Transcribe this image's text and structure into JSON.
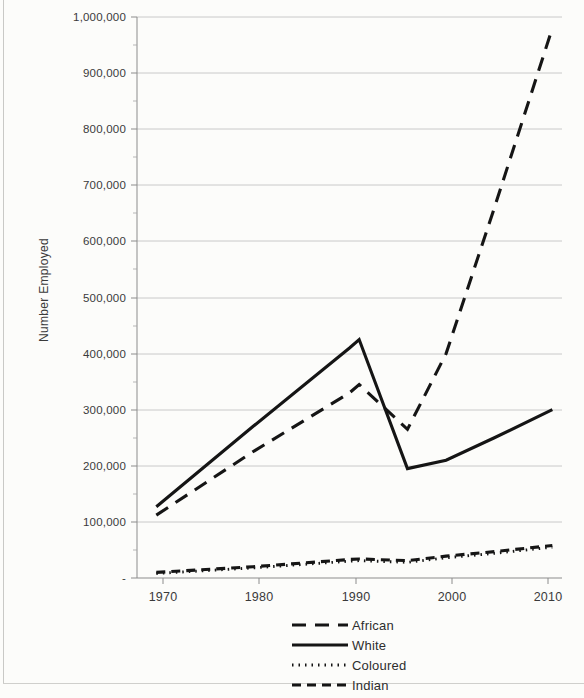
{
  "chart_data": {
    "type": "line",
    "title": "",
    "xlabel": "",
    "ylabel": "Number Employed",
    "x": [
      1970,
      1980,
      1990,
      1991,
      1996,
      2000,
      2005,
      2011
    ],
    "xlim": [
      1968,
      2012
    ],
    "ylim": [
      0,
      1000000
    ],
    "xticks": [
      1970,
      1980,
      1990,
      2000,
      2010
    ],
    "xtick_labels": [
      "1970",
      "1980",
      "1990",
      "2000",
      "2010"
    ],
    "yticks": [
      0,
      100000,
      200000,
      300000,
      400000,
      500000,
      600000,
      700000,
      800000,
      900000,
      1000000
    ],
    "ytick_labels": [
      "-",
      "100,000",
      "200,000",
      "300,000",
      "400,000",
      "500,000",
      "600,000",
      "700,000",
      "800,000",
      "900,000",
      "1,000,000"
    ],
    "grid": true,
    "legend_position": "bottom-center",
    "series": [
      {
        "name": "African",
        "style": "long-dashed",
        "points": [
          {
            "x": 1970,
            "y": 112000
          },
          {
            "x": 1980,
            "y": 225000
          },
          {
            "x": 1990,
            "y": 330000
          },
          {
            "x": 1991,
            "y": 345000
          },
          {
            "x": 1996,
            "y": 265000
          },
          {
            "x": 2000,
            "y": 400000
          },
          {
            "x": 2005,
            "y": 660000
          },
          {
            "x": 2011,
            "y": 980000
          }
        ]
      },
      {
        "name": "White",
        "style": "solid",
        "points": [
          {
            "x": 1970,
            "y": 127000
          },
          {
            "x": 1980,
            "y": 270000
          },
          {
            "x": 1990,
            "y": 410000
          },
          {
            "x": 1991,
            "y": 425000
          },
          {
            "x": 1996,
            "y": 195000
          },
          {
            "x": 2000,
            "y": 210000
          },
          {
            "x": 2005,
            "y": 250000
          },
          {
            "x": 2011,
            "y": 300000
          }
        ]
      },
      {
        "name": "Coloured",
        "style": "dotted",
        "points": [
          {
            "x": 1970,
            "y": 8000
          },
          {
            "x": 1980,
            "y": 18000
          },
          {
            "x": 1990,
            "y": 30000
          },
          {
            "x": 1991,
            "y": 31000
          },
          {
            "x": 1996,
            "y": 28000
          },
          {
            "x": 2000,
            "y": 36000
          },
          {
            "x": 2005,
            "y": 44000
          },
          {
            "x": 2011,
            "y": 55000
          }
        ]
      },
      {
        "name": "Indian",
        "style": "dashed",
        "points": [
          {
            "x": 1970,
            "y": 10000
          },
          {
            "x": 1980,
            "y": 20000
          },
          {
            "x": 1990,
            "y": 33000
          },
          {
            "x": 1991,
            "y": 34000
          },
          {
            "x": 1996,
            "y": 31000
          },
          {
            "x": 2000,
            "y": 39000
          },
          {
            "x": 2005,
            "y": 47000
          },
          {
            "x": 2011,
            "y": 58000
          }
        ]
      }
    ]
  },
  "axis": {
    "y_title": "Number Employed",
    "y_labels": [
      "1,000,000",
      "900,000",
      "800,000",
      "700,000",
      "600,000",
      "500,000",
      "400,000",
      "300,000",
      "200,000",
      "100,000",
      "-"
    ],
    "x_labels": [
      "1970",
      "1980",
      "1990",
      "2000",
      "2010"
    ]
  },
  "legend": {
    "entries": [
      {
        "label": "African",
        "style": "long-dashed"
      },
      {
        "label": "White",
        "style": "solid"
      },
      {
        "label": "Coloured",
        "style": "dotted"
      },
      {
        "label": "Indian",
        "style": "dashed"
      }
    ]
  },
  "colors": {
    "series": "#151515",
    "gridline": "#bdbdbd",
    "axis": "#8c8c8c",
    "background": "#fcfcfa",
    "text": "#2b2b2b"
  }
}
